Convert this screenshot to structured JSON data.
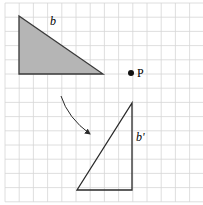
{
  "diagram": {
    "width": 203,
    "height": 205,
    "grid": {
      "x0": 5,
      "y0": 3,
      "spacing": 14.2,
      "cols": 14,
      "rows": 14,
      "color": "#d6d6d6",
      "border_color": "#c8c8c8"
    },
    "shape_b": {
      "label": "b",
      "points": [
        [
          19,
          16
        ],
        [
          19,
          74
        ],
        [
          103,
          74
        ]
      ],
      "fill": "#b5b5b5",
      "stroke": "#3a3a3a",
      "label_pos": [
        50,
        25
      ]
    },
    "point_p": {
      "label": "P",
      "x": 131,
      "y": 73,
      "color": "#111111"
    },
    "shape_b_prime": {
      "label": "b'",
      "points": [
        [
          132,
          103
        ],
        [
          132,
          190
        ],
        [
          77,
          190
        ]
      ],
      "fill": "none",
      "stroke": "#2a2a2a",
      "label_pos": [
        136,
        141
      ]
    },
    "arrow": {
      "from": [
        61,
        96
      ],
      "control": [
        68,
        118
      ],
      "to": [
        90,
        134
      ],
      "color": "#2a2a2a"
    }
  }
}
